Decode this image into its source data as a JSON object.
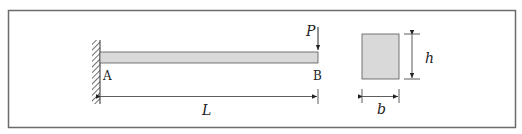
{
  "diagram": {
    "beam": {
      "support_label": "A",
      "free_end_label": "B",
      "load_label": "P",
      "length_label": "L",
      "fill_color": "#d9d9d9"
    },
    "cross_section": {
      "width_label": "b",
      "height_label": "h",
      "fill_color": "#d9d9d9"
    },
    "colors": {
      "frame": "#6b6b6b",
      "line": "#333333"
    }
  }
}
